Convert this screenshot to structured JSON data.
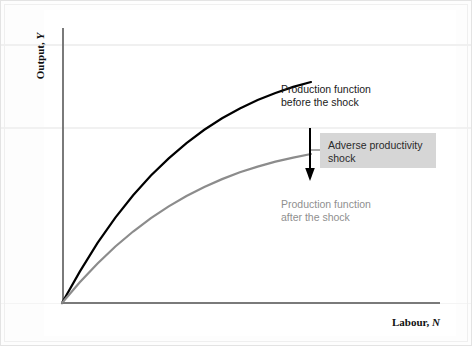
{
  "chart_data": {
    "type": "line",
    "title": "",
    "xlabel_text": "Labour, ",
    "xlabel_symbol": "N",
    "ylabel_text": "Output, ",
    "ylabel_symbol": "Y",
    "xlim": [
      0,
      100
    ],
    "ylim": [
      0,
      100
    ],
    "grid": false,
    "legend_position": "inline-annotations",
    "series": [
      {
        "name": "Production function before the shock",
        "color": "#000000",
        "x": [
          0,
          5,
          10,
          15,
          20,
          25,
          30,
          35,
          40,
          45,
          50,
          55,
          60,
          65,
          70
        ],
        "y": [
          0,
          11.5,
          22.0,
          31.3,
          39.5,
          46.7,
          53.0,
          58.6,
          63.5,
          67.7,
          71.3,
          74.4,
          77.0,
          79.2,
          81.0
        ]
      },
      {
        "name": "Production function after the shock",
        "color": "#8c8c8c",
        "x": [
          0,
          5,
          10,
          15,
          20,
          25,
          30,
          35,
          40,
          45,
          50,
          55,
          60,
          65,
          70
        ],
        "y": [
          0,
          7.6,
          14.5,
          20.7,
          26.2,
          31.1,
          35.4,
          39.2,
          42.5,
          45.4,
          47.9,
          50.0,
          51.8,
          53.3,
          54.6
        ]
      }
    ],
    "annotations": [
      {
        "id": "before",
        "text": "Production function\nbefore the shock",
        "color": "#1a1a1a"
      },
      {
        "id": "after",
        "text": "Production function\nafter the shock",
        "color": "#8f8f8f"
      },
      {
        "id": "shock",
        "text": "Adverse productivity\nshock",
        "color": "#2a2a2a",
        "box_color": "#d6d6d6"
      }
    ],
    "arrow": {
      "name": "downward-shift-arrow",
      "direction": "down",
      "color": "#000000",
      "meaning": "Adverse productivity shock shifts the production function down"
    }
  },
  "colors": {
    "before_curve": "#000000",
    "after_curve": "#8c8c8c",
    "axis": "#7a7a7a",
    "callout_box": "#d6d6d6",
    "background": "#ffffff"
  }
}
